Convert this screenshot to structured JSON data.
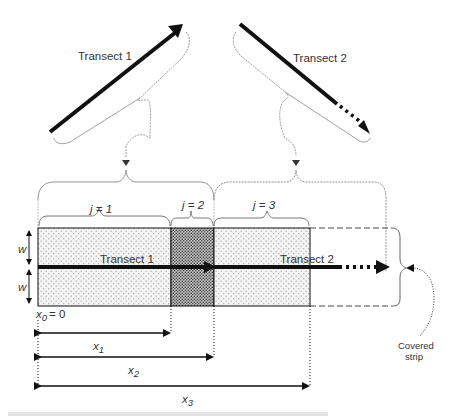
{
  "diagram": {
    "top_transects": [
      {
        "label": "Transect 1",
        "direction": "up-right",
        "style": "solid"
      },
      {
        "label": "Transect 2",
        "direction": "down-right",
        "style": "solid-then-dotted"
      }
    ],
    "segments": [
      {
        "label": "j = 1",
        "j": "j",
        "n": "1",
        "fill": "light-stipple"
      },
      {
        "label": "j = 2",
        "j": "j",
        "n": "2",
        "fill": "dense-stipple"
      },
      {
        "label": "j = 3",
        "j": "j",
        "n": "3",
        "fill": "light-stipple"
      }
    ],
    "strip": {
      "transect_1_label": "Transect 1",
      "transect_2_label": "Transect 2",
      "half_width_label": "w",
      "origin_label": "x",
      "origin_sub": "0",
      "origin_value": "= 0",
      "covered_strip_label_line1": "Covered",
      "covered_strip_label_line2": "strip"
    },
    "distances": [
      {
        "var": "x",
        "sub": "1"
      },
      {
        "var": "x",
        "sub": "2"
      },
      {
        "var": "x",
        "sub": "3"
      }
    ],
    "colors": {
      "line": "#111111",
      "brace": "#777777",
      "stipple_light": "#bdbdbd",
      "stipple_dense": "#444444"
    }
  }
}
